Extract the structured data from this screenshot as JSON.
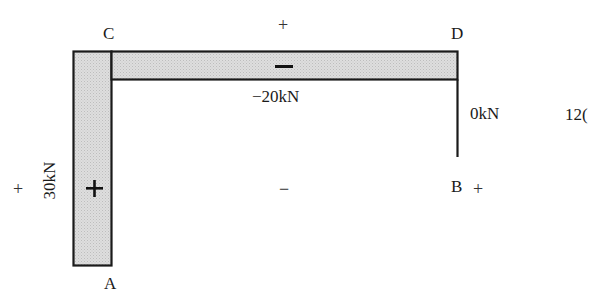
{
  "diagram": {
    "type": "axial-force-diagram",
    "fill_color": "#d9d9d9",
    "line_color": "#1a1a1a",
    "nodes": {
      "A": "A",
      "B": "B",
      "C": "C",
      "D": "D"
    },
    "members": [
      {
        "name": "column-AC",
        "from": "A",
        "to": "C",
        "value_label": "30kN",
        "sign_inside": "+"
      },
      {
        "name": "beam-CD",
        "from": "C",
        "to": "D",
        "value_label": "−20kN",
        "sign_inside": "−"
      },
      {
        "name": "column-DB",
        "from": "D",
        "to": "B",
        "value_label": "0kN"
      }
    ],
    "sign_markers": {
      "left_outer": "+",
      "top_outer": "+",
      "inner": "−",
      "right_near_b": "+"
    },
    "cropped_text": "12("
  }
}
